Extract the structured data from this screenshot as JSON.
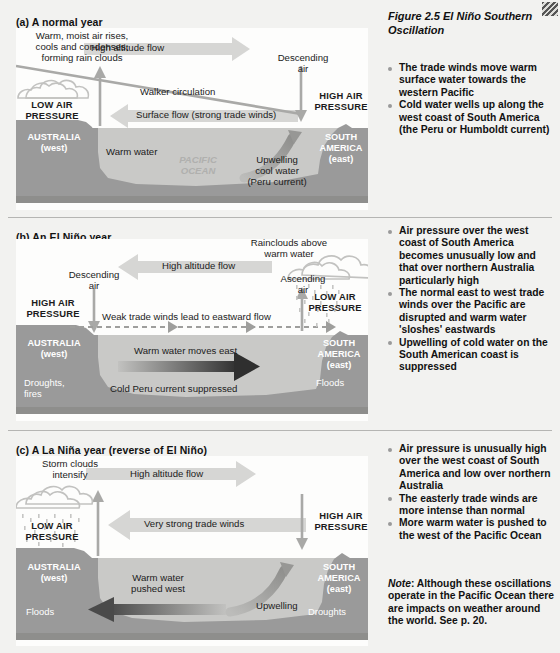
{
  "figure": {
    "caption": "Figure 2.5  El Niño Southern Oscillation"
  },
  "panels": [
    {
      "id": "normal-year",
      "title": "(a) A normal year",
      "labels": {
        "rising_air": "Warm, moist air rises,\ncools and condenses,\nforming rain clouds",
        "high_altitude_flow": "High altitude flow",
        "descending_air": "Descending\nair",
        "walker": "Walker circulation",
        "low_pressure": "LOW AIR\nPRESSURE",
        "high_pressure": "HIGH AIR\nPRESSURE",
        "surface_flow": "Surface flow (strong trade winds)",
        "australia": "AUSTRALIA\n(west)",
        "south_america": "SOUTH\nAMERICA\n(east)",
        "warm_water": "Warm water",
        "ocean_name": "PACIFIC\nOCEAN",
        "upwelling": "Upwelling\ncool water\n(Peru current)"
      },
      "notes": [
        "The trade winds move warm surface water towards the western Pacific",
        "Cold water wells up along the west coast of South America (the Peru or Humboldt current)"
      ]
    },
    {
      "id": "el-nino-year",
      "title": "(b) An El Niño year",
      "labels": {
        "rainclouds": "Rainclouds above\nwarm water",
        "high_altitude_flow": "High altitude flow",
        "descending_air": "Descending\nair",
        "ascending_air": "Ascending\nair",
        "high_pressure": "HIGH AIR\nPRESSURE",
        "low_pressure": "LOW AIR\nPRESSURE",
        "weak_trades": "Weak trade winds lead to eastward flow",
        "australia": "AUSTRALIA\n(west)",
        "south_america": "SOUTH\nAMERICA\n(east)",
        "warm_water_east": "Warm water moves east",
        "cold_peru": "Cold Peru current suppressed",
        "droughts": "Droughts,\nfires",
        "floods": "Floods"
      },
      "notes": [
        "Air pressure over the west coast of South America becomes unusually low and that over northern Australia particularly high",
        "The normal east to west trade winds over the Pacific are disrupted and warm water 'sloshes' eastwards",
        "Upwelling of cold water on the South American coast is suppressed"
      ]
    },
    {
      "id": "la-nina-year",
      "title": "(c) A La Niña year (reverse of El Niño)",
      "labels": {
        "storm_clouds": "Storm clouds\nintensify",
        "high_altitude_flow": "High altitude flow",
        "low_pressure": "LOW AIR\nPRESSURE",
        "high_pressure": "HIGH AIR\nPRESSURE",
        "strong_trades": "Very strong trade winds",
        "australia": "AUSTRALIA\n(west)",
        "south_america": "SOUTH\nAMERICA\n(east)",
        "warm_water_west": "Warm water\npushed west",
        "upwelling": "Upwelling",
        "floods": "Floods",
        "droughts": "Droughts"
      },
      "notes": [
        "Air pressure is unusually high over the west coast of South America and low over northern Australia",
        "The easterly trade winds are more intense than normal",
        "More warm water is pushed to the west of the Pacific Ocean"
      ]
    }
  ],
  "footnote": {
    "label": "Note",
    "text": ": Although these oscillations operate in the Pacific Ocean there are impacts on weather around the world. See p. 20."
  },
  "colors": {
    "background": "#f2f2f0",
    "land": "#9a9a9a",
    "water": "#c9c9c7",
    "sky": "#fdfdfc",
    "arrow_light": "#d2d2d0",
    "arrow_dark": "#3a3a3a",
    "divider": "#b5b5b3"
  }
}
